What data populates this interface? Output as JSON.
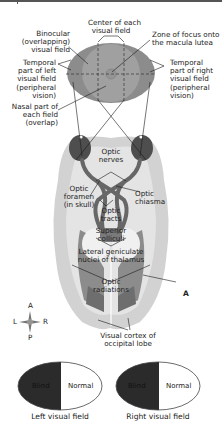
{
  "diagram": {
    "labels": {
      "center_of_field": "Center of each visual field",
      "center_of_field_l1": "Center of each",
      "center_of_field_l2": "visual field",
      "binocular_l1": "Binocular",
      "binocular_l2": "(overlapping)",
      "binocular_l3": "visual field",
      "zone_focus_l1": "Zone of focus onto",
      "zone_focus_l2": "the macula lutea",
      "temporal_left_l1": "Temporal",
      "temporal_left_l2": "part of left",
      "temporal_left_l3": "visual field",
      "temporal_left_l4": "(peripheral",
      "temporal_left_l5": "vision)",
      "temporal_right_l1": "Temporal",
      "temporal_right_l2": "part of right",
      "temporal_right_l3": "visual field",
      "temporal_right_l4": "(peripheral",
      "temporal_right_l5": "vision)",
      "nasal_l1": "Nasal part of",
      "nasal_l2": "each field",
      "nasal_l3": "(overlap)",
      "optic_nerves_l1": "Optic",
      "optic_nerves_l2": "nerves",
      "optic_foramen_l1": "Optic",
      "optic_foramen_l2": "foramen",
      "optic_foramen_l3": "(in skull)",
      "optic_chiasma_l1": "Optic",
      "optic_chiasma_l2": "chiasma",
      "optic_tracts_l1": "Optic",
      "optic_tracts_l2": "tracts",
      "superior_colliculi_l1": "Superior",
      "superior_colliculi_l2": "colliculi",
      "lgn_l1": "Lateral geniculate",
      "lgn_l2": "nuclei of thalamus",
      "optic_radiations_l1": "Optic",
      "optic_radiations_l2": "radiations",
      "lesion_marker": "A",
      "visual_cortex_l1": "Visual cortex of",
      "visual_cortex_l2": "occipital lobe"
    },
    "compass": {
      "anterior": "A",
      "posterior": "P",
      "left": "L",
      "right": "R"
    },
    "visual_fields": [
      {
        "caption": "Left visual field",
        "blind_label": "Blind",
        "normal_label": "Normal"
      },
      {
        "caption": "Right visual field",
        "blind_label": "Blind",
        "normal_label": "Normal"
      }
    ],
    "colors": {
      "field_outer": "#8a8a8a",
      "field_inner": "#9d9d9d",
      "brain_outer": "#d4d4d4",
      "brain_inner": "#e6e6e6",
      "eyeball": "#555555",
      "nerve_tract": "#6b6b6b",
      "blind": "#2b2b2b"
    }
  }
}
